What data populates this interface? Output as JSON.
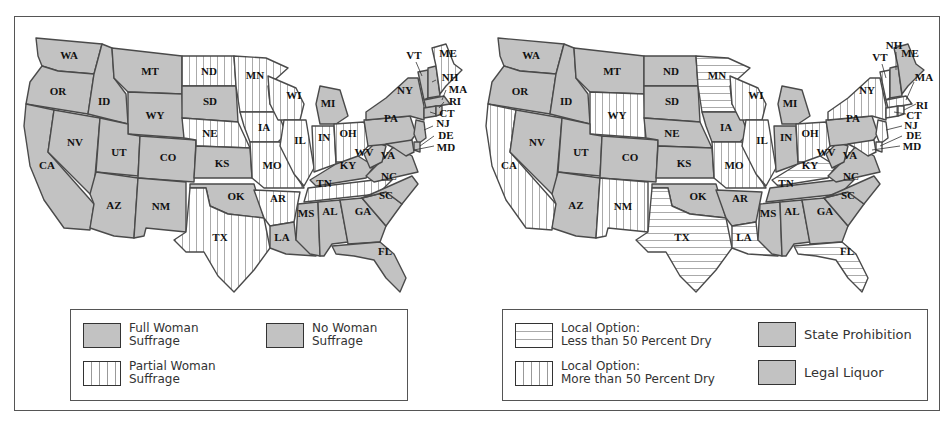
{
  "figure": {
    "panels": [
      {
        "id": "woman-suffrage",
        "legend": [
          {
            "pattern": "gray",
            "label_line1": "Full Woman",
            "label_line2": "Suffrage"
          },
          {
            "pattern": "gray",
            "label_line1": "No Woman",
            "label_line2": "Suffrage"
          },
          {
            "pattern": "vertical-stripes",
            "label_line1": "Partial Woman",
            "label_line2": "Suffrage"
          }
        ],
        "states": {
          "WA": "gray",
          "OR": "gray",
          "CA": "gray",
          "NV": "gray",
          "ID": "gray",
          "MT": "gray",
          "WY": "gray",
          "UT": "gray",
          "CO": "gray",
          "AZ": "gray",
          "NM": "gray",
          "ND": "vertical",
          "SD": "gray",
          "NE": "vertical",
          "KS": "gray",
          "OK": "gray",
          "TX": "vertical",
          "MN": "vertical",
          "IA": "vertical",
          "MO": "vertical",
          "AR": "vertical",
          "LA": "gray",
          "WI": "vertical",
          "IL": "vertical",
          "MI": "gray",
          "IN": "vertical",
          "OH": "vertical",
          "KY": "gray",
          "TN": "vertical",
          "MS": "gray",
          "AL": "gray",
          "GA": "gray",
          "FL": "gray",
          "SC": "gray",
          "NC": "gray",
          "VA": "gray",
          "WV": "gray",
          "PA": "gray",
          "NY": "gray",
          "VT": "gray",
          "NH": "gray",
          "ME": "vertical",
          "MA": "gray",
          "RI": "gray",
          "CT": "gray",
          "NJ": "gray",
          "DE": "gray",
          "MD": "gray"
        }
      },
      {
        "id": "prohibition",
        "legend": [
          {
            "pattern": "horizontal-stripes",
            "label_line1": "Local Option:",
            "label_line2": "Less than 50 Percent Dry"
          },
          {
            "pattern": "gray",
            "label_line1": "State Prohibition",
            "label_line2": ""
          },
          {
            "pattern": "vertical-stripes",
            "label_line1": "Local Option:",
            "label_line2": "More than 50 Percent Dry"
          },
          {
            "pattern": "gray",
            "label_line1": "Legal Liquor",
            "label_line2": ""
          }
        ],
        "states": {
          "WA": "gray",
          "OR": "gray",
          "CA": "vertical",
          "NV": "gray",
          "ID": "gray",
          "MT": "gray",
          "WY": "vertical",
          "UT": "gray",
          "CO": "gray",
          "AZ": "gray",
          "NM": "vertical",
          "ND": "gray",
          "SD": "gray",
          "NE": "gray",
          "KS": "gray",
          "OK": "gray",
          "TX": "horizontal",
          "MN": "horizontal",
          "IA": "gray",
          "MO": "vertical",
          "AR": "gray",
          "LA": "horizontal",
          "WI": "vertical",
          "IL": "vertical",
          "MI": "gray",
          "IN": "gray",
          "OH": "vertical",
          "KY": "horizontal",
          "TN": "gray",
          "MS": "gray",
          "AL": "gray",
          "GA": "gray",
          "FL": "horizontal",
          "SC": "gray",
          "NC": "gray",
          "VA": "gray",
          "WV": "gray",
          "PA": "gray",
          "NY": "vertical",
          "VT": "vertical",
          "NH": "gray",
          "ME": "gray",
          "MA": "vertical",
          "RI": "vertical",
          "CT": "vertical",
          "NJ": "vertical",
          "DE": "vertical",
          "MD": "vertical"
        }
      }
    ],
    "state_labels": [
      "WA",
      "OR",
      "CA",
      "NV",
      "ID",
      "MT",
      "WY",
      "UT",
      "CO",
      "AZ",
      "NM",
      "ND",
      "SD",
      "NE",
      "KS",
      "OK",
      "TX",
      "MN",
      "IA",
      "MO",
      "AR",
      "LA",
      "WI",
      "IL",
      "MI",
      "IN",
      "OH",
      "KY",
      "TN",
      "MS",
      "AL",
      "GA",
      "FL",
      "SC",
      "NC",
      "VA",
      "WV",
      "PA",
      "NY",
      "VT",
      "NH",
      "ME",
      "MA",
      "RI",
      "CT",
      "NJ",
      "DE",
      "MD"
    ]
  },
  "colors": {
    "gray_fill": "#c2c2c2",
    "stroke": "#4a4a4a",
    "stripe": "#999999",
    "background": "#ffffff"
  }
}
